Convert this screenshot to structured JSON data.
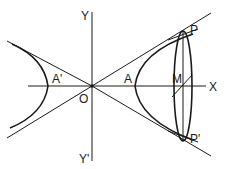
{
  "diagram": {
    "type": "hyperbola-with-rotated-ellipse",
    "labels": {
      "y_top": "Y",
      "y_bottom": "Y'",
      "x_right": "X",
      "origin": "O",
      "vertex_left": "A'",
      "vertex_right": "A",
      "center_section": "M",
      "point_top": "P",
      "point_bottom": "P'"
    },
    "colors": {
      "stroke": "#1a1a1a",
      "background": "#ffffff"
    }
  }
}
